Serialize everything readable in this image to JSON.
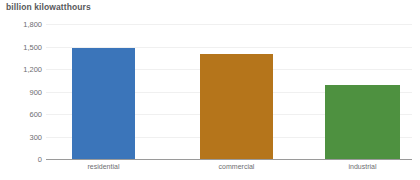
{
  "chart_data": {
    "type": "bar",
    "title": "billion kilowatthours",
    "xlabel": "",
    "ylabel": "billion kilowatthours",
    "categories": [
      "residential",
      "commercial",
      "industrial"
    ],
    "values": [
      1480,
      1400,
      990
    ],
    "series": [
      {
        "name": "electricity retail sales",
        "values": [
          1480,
          1400,
          990
        ]
      }
    ],
    "colors": [
      "#3b75ba",
      "#b5751b",
      "#4e9140"
    ],
    "ylim": [
      0,
      1800
    ],
    "yticks": [
      0,
      300,
      600,
      900,
      1200,
      1500,
      1800
    ],
    "ytick_labels": [
      "0",
      "300",
      "600",
      "900",
      "1,200",
      "1,500",
      "1,800"
    ],
    "grid": true,
    "legend": "none",
    "axis_color": "#9a9a9a",
    "grid_color": "#f0f0f0",
    "text_color": "#6d6e71",
    "title_color": "#58595b"
  }
}
